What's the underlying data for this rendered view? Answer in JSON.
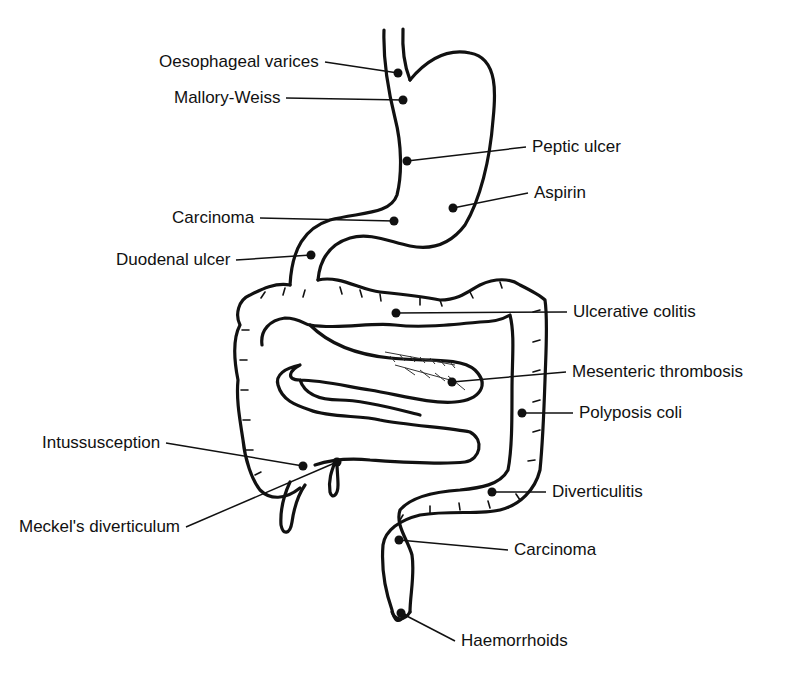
{
  "diagram": {
    "labels": [
      {
        "id": "oesophageal-varices",
        "text": "Oesophageal varices",
        "x": 159,
        "y": 52,
        "anchor": "left",
        "dot": [
          398,
          73
        ]
      },
      {
        "id": "mallory-weiss",
        "text": "Mallory-Weiss",
        "x": 174,
        "y": 88,
        "anchor": "left",
        "dot": [
          403,
          100
        ]
      },
      {
        "id": "peptic-ulcer",
        "text": "Peptic ulcer",
        "x": 532,
        "y": 137,
        "anchor": "left",
        "dot": [
          407,
          161
        ]
      },
      {
        "id": "aspirin",
        "text": "Aspirin",
        "x": 534,
        "y": 183,
        "anchor": "left",
        "dot": [
          453,
          208
        ]
      },
      {
        "id": "carcinoma-stomach",
        "text": "Carcinoma",
        "x": 172,
        "y": 208,
        "anchor": "left",
        "dot": [
          394,
          221
        ]
      },
      {
        "id": "duodenal-ulcer",
        "text": "Duodenal ulcer",
        "x": 116,
        "y": 250,
        "anchor": "left",
        "dot": [
          311,
          255
        ]
      },
      {
        "id": "ulcerative-colitis",
        "text": "Ulcerative colitis",
        "x": 573,
        "y": 302,
        "anchor": "left",
        "dot": [
          396,
          313
        ]
      },
      {
        "id": "mesenteric-thrombosis",
        "text": "Mesenteric thrombosis",
        "x": 572,
        "y": 362,
        "anchor": "left",
        "dot": [
          452,
          382
        ]
      },
      {
        "id": "polyposis-coli",
        "text": "Polyposis coli",
        "x": 579,
        "y": 403,
        "anchor": "left",
        "dot": [
          522,
          413
        ]
      },
      {
        "id": "intussusception",
        "text": "Intussusception",
        "x": 42,
        "y": 433,
        "anchor": "left",
        "dot": [
          303,
          466
        ]
      },
      {
        "id": "diverticulitis",
        "text": "Diverticulitis",
        "x": 552,
        "y": 482,
        "anchor": "left",
        "dot": [
          492,
          492
        ]
      },
      {
        "id": "meckels-diverticulum",
        "text": "Meckel's diverticulum",
        "x": 19,
        "y": 517,
        "anchor": "left",
        "dot": [
          337,
          462
        ]
      },
      {
        "id": "carcinoma-colon",
        "text": "Carcinoma",
        "x": 514,
        "y": 540,
        "anchor": "left",
        "dot": [
          399,
          540
        ]
      },
      {
        "id": "haemorrhoids",
        "text": "Haemorrhoids",
        "x": 461,
        "y": 631,
        "anchor": "left",
        "dot": [
          401,
          613
        ]
      }
    ]
  }
}
